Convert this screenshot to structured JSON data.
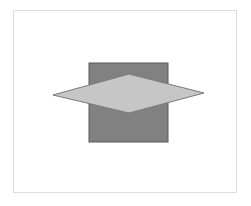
{
  "canvas": {
    "width": 251,
    "height": 206,
    "background": "#ffffff",
    "frame": {
      "x": 13,
      "y": 10,
      "width": 224,
      "height": 183,
      "stroke": "#dcdcdc"
    }
  },
  "shapes": [
    {
      "name": "square",
      "type": "rect",
      "x": 89,
      "y": 63,
      "width": 79,
      "height": 79,
      "fill": "#818181",
      "stroke": "#5a5a5a"
    },
    {
      "name": "diamond",
      "type": "polygon",
      "points": [
        [
          53,
          95
        ],
        [
          129,
          74
        ],
        [
          204,
          93
        ],
        [
          129,
          113
        ]
      ],
      "fill": "#c6c6c6",
      "stroke": "#7a7a7a"
    }
  ]
}
